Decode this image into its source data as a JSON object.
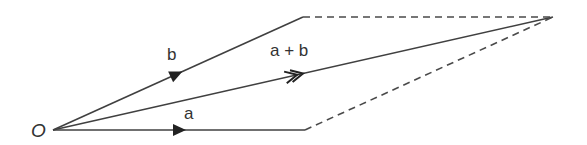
{
  "diagram": {
    "title": "",
    "type": "vector-addition-parallelogram",
    "colors": {
      "line": "#404040",
      "dashed": "#4a4a4a",
      "text": "#333333",
      "background": "#ffffff"
    },
    "points": {
      "O": [
        53,
        130
      ],
      "A": [
        305,
        130
      ],
      "B": [
        303,
        17
      ],
      "C": [
        553,
        17
      ]
    },
    "labels": {
      "origin": "O",
      "vector_a": "a",
      "vector_b": "b",
      "vector_sum": "a + b"
    },
    "edges": [
      {
        "from": "O",
        "to": "A",
        "style": "solid",
        "label": "a",
        "arrow": "single"
      },
      {
        "from": "O",
        "to": "B",
        "style": "solid",
        "label": "b",
        "arrow": "single"
      },
      {
        "from": "O",
        "to": "C",
        "style": "solid",
        "label": "a + b",
        "arrow": "double"
      },
      {
        "from": "B",
        "to": "C",
        "style": "dashed"
      },
      {
        "from": "A",
        "to": "C",
        "style": "dashed"
      }
    ]
  }
}
